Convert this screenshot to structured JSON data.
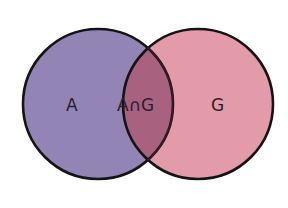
{
  "diagram": {
    "type": "venn",
    "sets": [
      {
        "id": "A",
        "label": "A",
        "color": "#9285b5"
      },
      {
        "id": "G",
        "label": "G",
        "color": "#e39aa9"
      }
    ],
    "intersection": {
      "label": "A∩G",
      "color": "#a8617f"
    },
    "outline_color": "#141414"
  }
}
